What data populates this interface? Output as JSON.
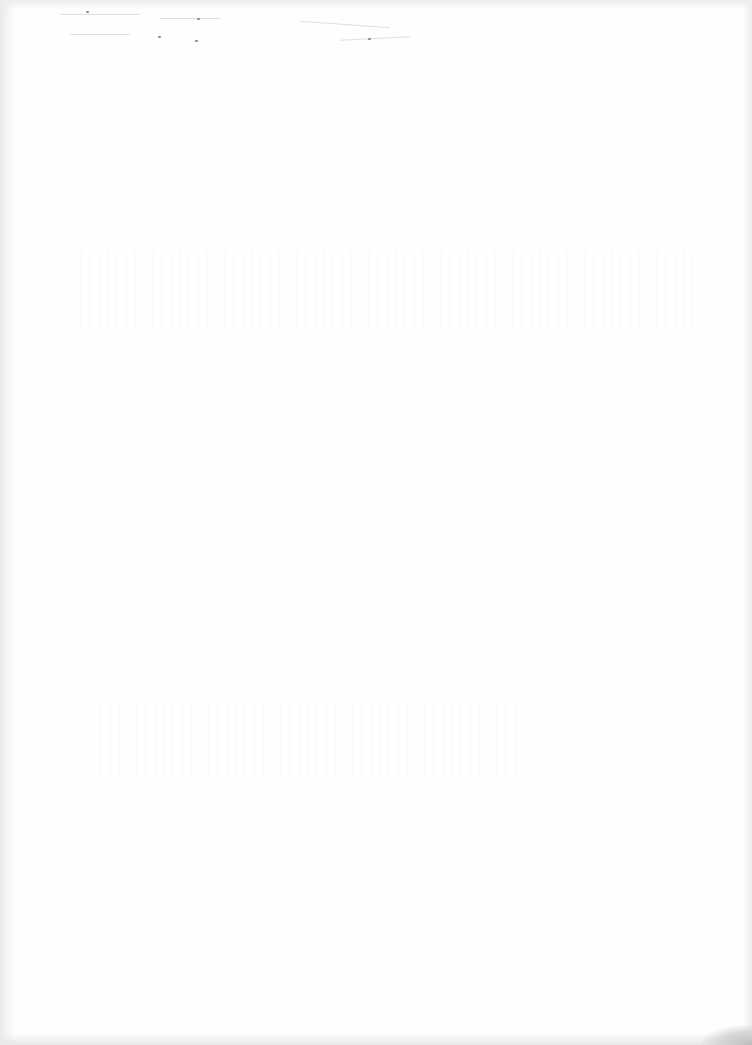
{
  "document": {
    "type": "scanned-page",
    "description": "Blank scanned page with faint illegible bleed-through marks",
    "visible_text": []
  }
}
